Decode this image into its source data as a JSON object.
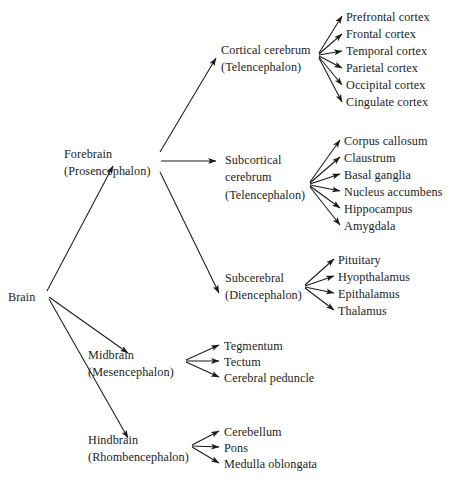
{
  "diagram": {
    "type": "tree",
    "root": {
      "label": "Brain",
      "x": 8,
      "y": 289
    },
    "nodes": {
      "forebrain": {
        "line1": "Forebrain",
        "line2": "(Prosencephalon)",
        "x": 64,
        "y": 146
      },
      "midbrain": {
        "line1": "Midbrain",
        "line2": "(Mesencephalon)",
        "x": 88,
        "y": 347
      },
      "hindbrain": {
        "line1": "Hindbrain",
        "line2": "(Rhombencephalon)",
        "x": 88,
        "y": 432
      },
      "cortical": {
        "line1": "Cortical cerebrum",
        "line2": "(Telencephalon)",
        "x": 221,
        "y": 42
      },
      "subcortical": {
        "line1": "Subcortical",
        "line2": "cerebrum",
        "line3": "(Telencephalon)",
        "x": 225,
        "y": 152
      },
      "subcerebral": {
        "line1": "Subcerebral",
        "line2": "(Diencephalon)",
        "x": 225,
        "y": 270
      }
    },
    "leaf_groups": {
      "cortical_leaves": [
        "Prefrontal cortex",
        "Frontal cortex",
        "Temporal cortex",
        "Parietal cortex",
        "Occipital cortex",
        "Cingulate cortex"
      ],
      "subcortical_leaves": [
        "Corpus callosum",
        "Claustrum",
        "Basal ganglia",
        "Nucleus accumbens",
        "Hippocampus",
        "Amygdala"
      ],
      "subcerebral_leaves": [
        "Pituitary",
        "Hyopthalamus",
        "Epithalamus",
        "Thalamus"
      ],
      "midbrain_leaves": [
        "Tegmentum",
        "Tectum",
        "Cerebral peduncle"
      ],
      "hindbrain_leaves": [
        "Cerebellum",
        "Pons",
        "Medulla oblongata"
      ]
    },
    "style": {
      "background": "#ffffff",
      "text_color": "#1c1c1c",
      "edge_color": "#1a1a1a"
    }
  }
}
